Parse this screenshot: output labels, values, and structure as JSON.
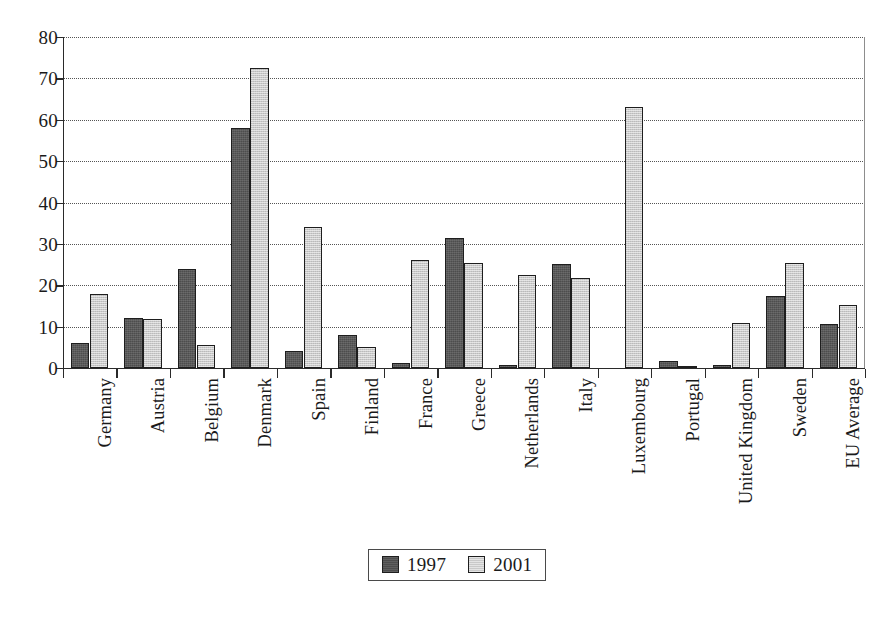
{
  "chart_data": {
    "type": "bar",
    "title": "",
    "subtitle": "",
    "xlabel": "",
    "ylabel": "",
    "ylim": [
      0,
      80
    ],
    "yticks": [
      0,
      10,
      20,
      30,
      40,
      50,
      60,
      70,
      80
    ],
    "grid": true,
    "grid_style": "dotted-horizontal",
    "legend_position": "bottom-center",
    "categories": [
      "Germany",
      "Austria",
      "Belgium",
      "Denmark",
      "Spain",
      "Finland",
      "France",
      "Greece",
      "Netherlands",
      "Italy",
      "Luxembourg",
      "Portugal",
      "United Kingdom",
      "Sweden",
      "EU Average"
    ],
    "series": [
      {
        "name": "1997",
        "color": "#4d4d4d",
        "values": [
          6.0,
          12.2,
          24.0,
          58.0,
          4.0,
          7.9,
          1.3,
          31.5,
          0.8,
          25.1,
          0,
          1.7,
          0.7,
          17.4,
          10.7
        ]
      },
      {
        "name": "2001",
        "color": "#c9c9c9",
        "values": [
          17.8,
          11.8,
          5.5,
          72.5,
          34.0,
          5.0,
          26.0,
          25.5,
          22.5,
          21.8,
          63.0,
          0.2,
          11.0,
          25.4,
          15.3
        ]
      }
    ]
  },
  "legend": {
    "items": [
      {
        "label": "1997",
        "swatch": "dark-swatch-icon"
      },
      {
        "label": "2001",
        "swatch": "light-swatch-icon"
      }
    ]
  },
  "axis": {
    "y_tick_labels": [
      "80",
      "70",
      "60",
      "50",
      "40",
      "30",
      "20",
      "10",
      "0"
    ]
  }
}
